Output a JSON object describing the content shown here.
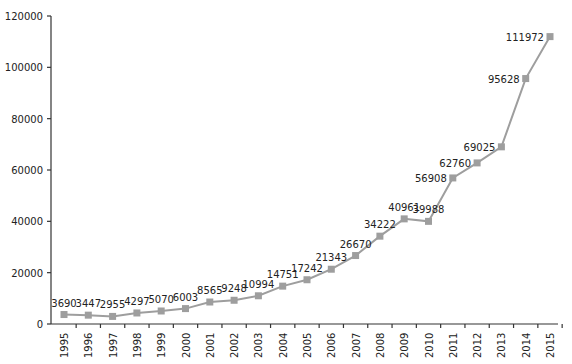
{
  "chart_data": {
    "type": "line",
    "title": "",
    "xlabel": "",
    "ylabel": "",
    "categories": [
      "1995",
      "1996",
      "1997",
      "1998",
      "1999",
      "2000",
      "2001",
      "2002",
      "2003",
      "2004",
      "2005",
      "2006",
      "2007",
      "2008",
      "2009",
      "2010",
      "2011",
      "2012",
      "2013",
      "2014",
      "2015"
    ],
    "series": [
      {
        "name": "",
        "values": [
          3690,
          3447,
          2955,
          4297,
          5070,
          6003,
          8565,
          9248,
          10994,
          14751,
          17242,
          21343,
          26670,
          34222,
          40961,
          39988,
          56908,
          62760,
          69025,
          95628,
          111972
        ],
        "color": "#9e9e9e",
        "marker": "square",
        "data_labels": true
      }
    ],
    "ylim": [
      0,
      120000
    ],
    "yticks": [
      0,
      20000,
      40000,
      60000,
      80000,
      100000,
      120000
    ],
    "ytick_labels": [
      "0",
      "20000",
      "40000",
      "60000",
      "80000",
      "100000",
      "120000"
    ],
    "xtick_rotation": -90,
    "grid": false,
    "legend": null
  }
}
